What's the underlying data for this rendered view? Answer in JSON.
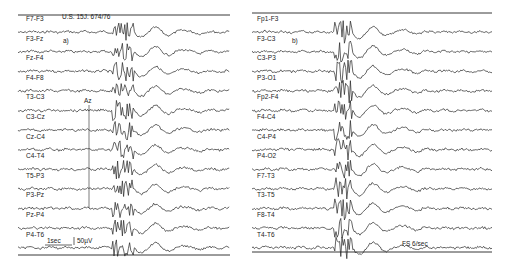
{
  "figure": {
    "type": "EEG recording",
    "ink_color": "#222222",
    "background": "#ffffff"
  },
  "panel_a": {
    "letter": "a)",
    "patient_id": "U.S. 15J. 674/76",
    "marker": "Az",
    "scale_time": "1sec",
    "scale_amplitude": "50µV",
    "channels": [
      "F7-F3",
      "F3-Fz",
      "Fz-F4",
      "F4-F8",
      "T3-C3",
      "C3-Cz",
      "Cz-C4",
      "C4-T4",
      "T5-P3",
      "P3-Pz",
      "Pz-P4",
      "P4-T6"
    ]
  },
  "panel_b": {
    "letter": "b)",
    "stimulus": "FS 6/sec",
    "channels": [
      "Fp1-F3",
      "F3-C3",
      "C3-P3",
      "P3-O1",
      "Fp2-F4",
      "F4-C4",
      "C4-P4",
      "P4-O2",
      "F7-T3",
      "T3-T5",
      "F8-T4",
      "T4-T6"
    ]
  }
}
